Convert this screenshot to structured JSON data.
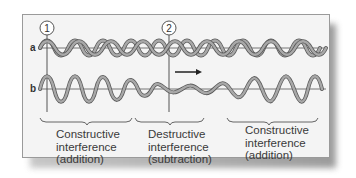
{
  "figure": {
    "markers": [
      {
        "id": "1",
        "label": "1"
      },
      {
        "id": "2",
        "label": "2"
      }
    ],
    "rows": [
      {
        "id": "a",
        "label": "a"
      },
      {
        "id": "b",
        "label": "b"
      }
    ],
    "direction_arrow": "right",
    "regions": [
      {
        "title": "Constructive",
        "line2": "interference",
        "line3": "(addition)"
      },
      {
        "title": "Destructive",
        "line2": "interference",
        "line3": "(subtraction)"
      },
      {
        "title": "Constructive",
        "line2": "interference",
        "line3": "(addition)"
      }
    ],
    "colors": {
      "wave_fill": "#9a9a9a",
      "wave_outline": "#5a5a5a",
      "axis": "#555555",
      "panel_bg": "#f4f4f4",
      "text": "#3a3a3a"
    }
  }
}
